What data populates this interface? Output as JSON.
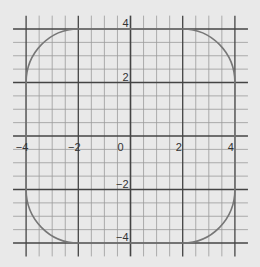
{
  "chart_data": {
    "type": "line",
    "title": "",
    "xlabel": "",
    "ylabel": "",
    "xlim": [
      -4.5,
      4.5
    ],
    "ylim": [
      -4.5,
      4.5
    ],
    "grid": true,
    "grid_minor_step": 0.5,
    "grid_major_step": 2,
    "x_ticks": [
      -4,
      -2,
      0,
      2,
      4
    ],
    "x_tick_labels": [
      "−4",
      "−2",
      "0",
      "2",
      "4"
    ],
    "y_ticks": [
      4,
      2,
      -2,
      -4
    ],
    "y_tick_labels": [
      "4",
      "2",
      "−2",
      "−4"
    ],
    "series": [
      {
        "name": "rounded square",
        "description": "Closed curve: straight segments on x=±4 (|y|≤2) and y=±4 (|x|≤2), joined by quarter-circle arcs of radius 2 centered at (±2,±2)",
        "x": [
          -2,
          2,
          2.59,
          3.41,
          4,
          4,
          3.41,
          2.59,
          2,
          -2,
          -2.59,
          -3.41,
          -4,
          -4,
          -3.41,
          -2.59,
          -2
        ],
        "y": [
          4,
          4,
          3.85,
          3.41,
          2,
          -2,
          -3.41,
          -3.85,
          -4,
          -4,
          -3.85,
          -3.41,
          -2,
          2,
          3.41,
          3.85,
          4
        ],
        "color": "#777777"
      }
    ],
    "colors": {
      "background": "#e9e9e9",
      "minor_grid": "#9a9a9a",
      "major_grid": "#444444",
      "curve": "#777777"
    }
  }
}
